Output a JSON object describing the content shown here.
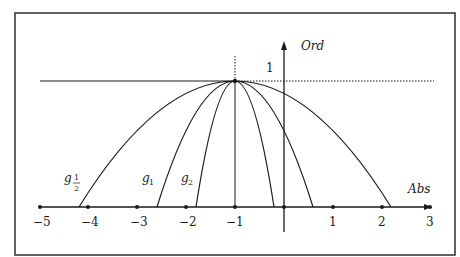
{
  "diagram": {
    "axes": {
      "x_label": "Abs",
      "y_label": "Ord",
      "x_ticks": [
        "−5",
        "−4",
        "−3",
        "−2",
        "−1",
        "1",
        "2",
        "3"
      ],
      "x_tick_values": [
        -5,
        -4,
        -3,
        -2,
        -1,
        1,
        2,
        3
      ],
      "y_tick_label": "1",
      "x_range": [
        -5,
        3
      ]
    },
    "curves": [
      {
        "name": "g_1/2",
        "label_main": "g",
        "label_sub": "1/2",
        "sub_num": "1",
        "sub_den": "2",
        "half_width": 3.2,
        "roots": [
          -4.2,
          2.2
        ]
      },
      {
        "name": "g_1",
        "label_main": "g",
        "label_sub": "1",
        "half_width": 1.6,
        "roots": [
          -2.6,
          0.6
        ]
      },
      {
        "name": "g_2",
        "label_main": "g",
        "label_sub": "2",
        "half_width": 0.8,
        "roots": [
          -1.8,
          -0.2
        ]
      }
    ],
    "vertex": {
      "x": -1,
      "y": 1
    },
    "colors": {
      "ink": "#1a1a1a",
      "frame": "#3a3a3a",
      "background": "#ffffff"
    }
  }
}
